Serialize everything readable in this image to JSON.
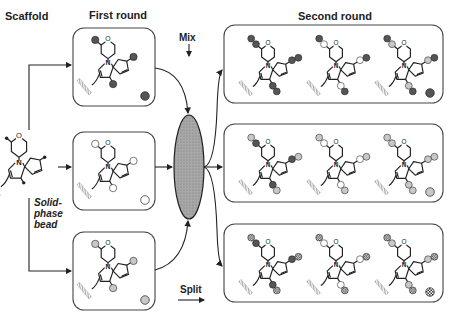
{
  "labels": {
    "scaffold": "Scaffold",
    "first_round": "First round",
    "second_round": "Second round",
    "mix": "Mix",
    "split": "Split",
    "bead_line1": "Solid-",
    "bead_line2": "phase",
    "bead_line3": "bead"
  },
  "colors": {
    "dark": "#555555",
    "white": "#ffffff",
    "light": "#c8c8c8",
    "checker": "checker",
    "ellipse_fill": "#9a9a9a",
    "stroke": "#222222",
    "box_border": "#444444"
  },
  "first_round": [
    {
      "building_block": "dark"
    },
    {
      "building_block": "white"
    },
    {
      "building_block": "light"
    }
  ],
  "second_round": [
    {
      "building_block": "dark",
      "products": [
        {
          "first": "dark",
          "second": "dark"
        },
        {
          "first": "white",
          "second": "dark"
        },
        {
          "first": "light",
          "second": "dark"
        }
      ]
    },
    {
      "building_block": "light",
      "products": [
        {
          "first": "dark",
          "second": "light"
        },
        {
          "first": "white",
          "second": "light"
        },
        {
          "first": "light",
          "second": "light"
        }
      ]
    },
    {
      "building_block": "checker",
      "products": [
        {
          "first": "dark",
          "second": "checker"
        },
        {
          "first": "white",
          "second": "checker"
        },
        {
          "first": "light",
          "second": "checker"
        }
      ]
    }
  ]
}
